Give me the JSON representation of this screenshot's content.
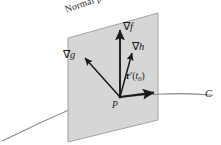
{
  "figure": {
    "title_label": "Normal plane",
    "point_label": "P",
    "curve_label": "C",
    "vectors": [
      {
        "name": "grad-f",
        "label_nabla": "∇",
        "label_var": "f",
        "tip": [
          120,
          28
        ],
        "tail": [
          120,
          97
        ]
      },
      {
        "name": "grad-g",
        "label_nabla": "∇",
        "label_var": "g",
        "tip": [
          83,
          56
        ],
        "tail": [
          120,
          97
        ]
      },
      {
        "name": "grad-h",
        "label_nabla": "∇",
        "label_var": "h",
        "tip": [
          131,
          51
        ],
        "tail": [
          120,
          97
        ]
      },
      {
        "name": "r-prime",
        "label_nabla": "",
        "label_var": "",
        "tip": [
          157,
          92
        ],
        "tail": [
          120,
          97
        ]
      }
    ],
    "tangent": {
      "label_r": "r",
      "label_prime": "′",
      "label_open": "(",
      "label_t": "t",
      "label_sub": "0",
      "label_close": ")"
    },
    "plane": {
      "corners": [
        [
          68,
          38
        ],
        [
          158,
          13
        ],
        [
          158,
          120
        ],
        [
          68,
          142
        ]
      ],
      "fill": "#d6d6d6",
      "stroke": "#9a9a9a"
    },
    "curve": {
      "stroke": "#8a8a8a",
      "path": "M 2 141 C 30 128 72 106 108 98 C 140 91 180 90 214 94"
    },
    "colors": {
      "arrow": "#1a1a1a",
      "background": "#ffffff",
      "text": "#1a1a1a"
    }
  }
}
